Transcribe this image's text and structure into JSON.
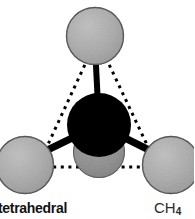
{
  "figure": {
    "width": 194,
    "height": 219,
    "background_color": "#ffffff",
    "caption_shape": "tetrahedral",
    "formula_symbol": "CH",
    "formula_subscript": "4"
  },
  "colors": {
    "hydrogen_fill": "#a9a9a9",
    "hydrogen_fill_dark": "#8e8e8e",
    "hydrogen_outline": "#4a4a4a",
    "carbon_fill": "#000000",
    "bond": "#000000",
    "dotted_edge": "#000000",
    "label_text": "#111111",
    "formula_text": "#2b2b2b"
  },
  "atoms": [
    {
      "name": "hydrogen-top",
      "element": "H",
      "cx": 95,
      "cy": 36,
      "r": 28,
      "shade": "light",
      "z": 2
    },
    {
      "name": "hydrogen-bottom-left",
      "element": "H",
      "cx": 25,
      "cy": 165,
      "r": 28,
      "shade": "light",
      "z": 2
    },
    {
      "name": "hydrogen-bottom-right",
      "element": "H",
      "cx": 171,
      "cy": 165,
      "r": 28,
      "shade": "light",
      "z": 2
    },
    {
      "name": "hydrogen-rear-center",
      "element": "H",
      "cx": 99,
      "cy": 152,
      "r": 25,
      "shade": "dark",
      "z": 1
    },
    {
      "name": "carbon-center",
      "element": "C",
      "cx": 99,
      "cy": 125,
      "r": 32,
      "shade": "black",
      "z": 3
    }
  ],
  "bonds": [
    {
      "name": "bond-carbon-hydrogen-top",
      "x1": 99,
      "y1": 125,
      "x2": 95,
      "y2": 46,
      "width": 6
    },
    {
      "name": "bond-carbon-hydrogen-bottom-left",
      "x1": 99,
      "y1": 125,
      "x2": 33,
      "y2": 157,
      "width": 7
    },
    {
      "name": "bond-carbon-hydrogen-bottom-right",
      "x1": 99,
      "y1": 125,
      "x2": 163,
      "y2": 157,
      "width": 7
    }
  ],
  "tetrahedron_edges": [
    {
      "name": "edge-top-to-bottom-left",
      "x1": 88,
      "y1": 58,
      "x2": 38,
      "y2": 166
    },
    {
      "name": "edge-top-to-bottom-right",
      "x1": 106,
      "y1": 58,
      "x2": 157,
      "y2": 166
    },
    {
      "name": "edge-bottom-left-to-bottom-right",
      "x1": 38,
      "y1": 167,
      "x2": 157,
      "y2": 167
    }
  ],
  "geometry": {
    "name": "tetrahedral",
    "bond_angle_degrees": 109.5,
    "coordination_number": 4
  }
}
